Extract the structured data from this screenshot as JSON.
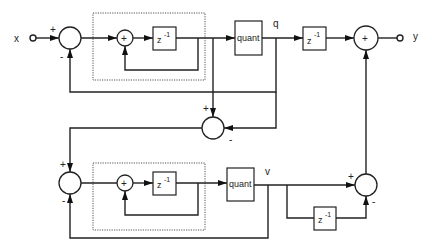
{
  "diagram": {
    "type": "block-diagram",
    "title": "",
    "signals": {
      "input": "x",
      "output": "y",
      "q": "q",
      "v": "v"
    },
    "blocks": {
      "delay_label": "z",
      "delay_exp": "-1",
      "quant_label": "quant",
      "adder_sign": "+"
    },
    "signs": {
      "plus": "+",
      "minus": "-"
    },
    "stages": [
      {
        "name": "first-stage",
        "components": [
          "summer",
          "integrator (adder + z^-1 loop)",
          "quant",
          "z^-1",
          "output summer"
        ]
      },
      {
        "name": "second-stage",
        "components": [
          "error summer",
          "summer",
          "integrator (adder + z^-1 loop)",
          "quant",
          "differentiator (1 - z^-1)"
        ]
      }
    ]
  }
}
